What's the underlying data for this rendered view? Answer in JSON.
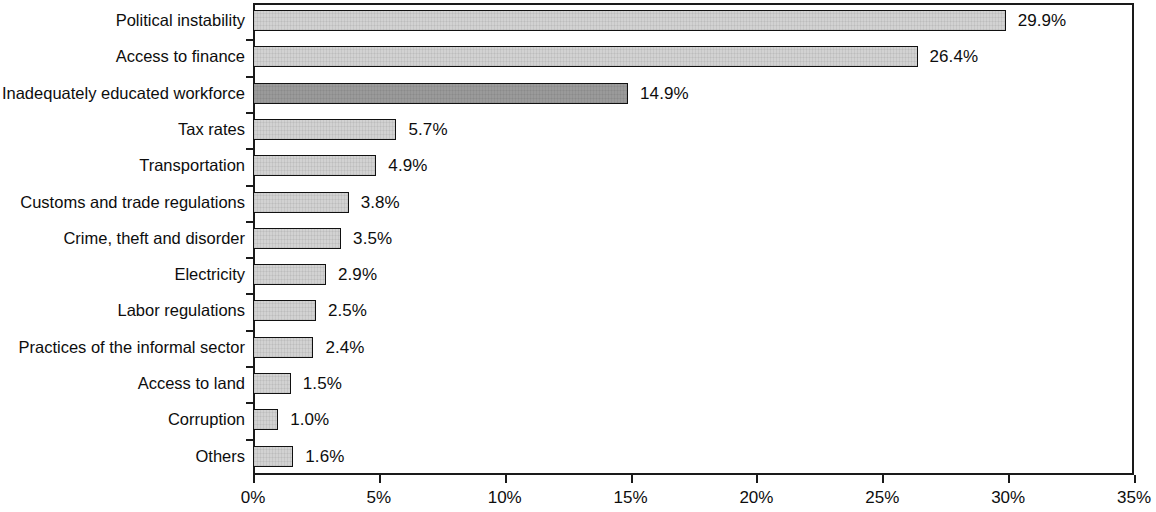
{
  "chart_data": {
    "type": "bar",
    "orientation": "horizontal",
    "title": "",
    "subtitle": "",
    "xlabel": "",
    "ylabel": "",
    "xlim": [
      0,
      35
    ],
    "xtick_step": 5,
    "grid": false,
    "legend": null,
    "value_label_suffix": "%",
    "categories": [
      "Political instability",
      "Access to finance",
      "Inadequately educated workforce",
      "Tax rates",
      "Transportation",
      "Customs and trade regulations",
      "Crime, theft and disorder",
      "Electricity",
      "Labor regulations",
      "Practices of the informal sector",
      "Access to land",
      "Corruption",
      "Others"
    ],
    "values": [
      29.9,
      26.4,
      14.9,
      5.7,
      4.9,
      3.8,
      3.5,
      2.9,
      2.5,
      2.4,
      1.5,
      1.0,
      1.6
    ],
    "value_labels": [
      "29.9%",
      "26.4%",
      "14.9%",
      "5.7%",
      "4.9%",
      "3.8%",
      "3.5%",
      "2.9%",
      "2.5%",
      "2.4%",
      "1.5%",
      "1.0%",
      "1.6%"
    ],
    "highlighted_index": 2,
    "xticks": [
      0,
      5,
      10,
      15,
      20,
      25,
      30,
      35
    ],
    "xtick_labels": [
      "0%",
      "5%",
      "10%",
      "15%",
      "20%",
      "25%",
      "30%",
      "35%"
    ],
    "colors": {
      "bar_fill": "#d2d2d2",
      "bar_highlight_fill": "#9a9a9a",
      "bar_outline": "#111111",
      "axis": "#1a1a1a",
      "text": "#0d0d0d",
      "background": "#ffffff"
    }
  }
}
